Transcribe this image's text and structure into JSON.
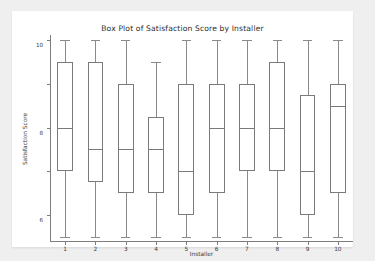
{
  "chart_data": {
    "type": "box",
    "title": "Box Plot of Satisfaction Score by Installer",
    "xlabel": "Installer",
    "ylabel": "Satisfaction Score",
    "categories": [
      "1",
      "2",
      "3",
      "4",
      "5",
      "6",
      "7",
      "8",
      "9",
      "10"
    ],
    "ylim": [
      1,
      10
    ],
    "yticks": [
      2,
      4,
      6,
      8,
      10
    ],
    "ytick_labels": [
      "2",
      "4",
      "6",
      "8",
      "10"
    ],
    "grid": false,
    "legend": null,
    "boxes": [
      {
        "category": "1",
        "whisker_low": 1,
        "q1": 4,
        "median": 6,
        "q3": 9,
        "whisker_high": 10
      },
      {
        "category": "2",
        "whisker_low": 1,
        "q1": 3.5,
        "median": 5,
        "q3": 9,
        "whisker_high": 10
      },
      {
        "category": "3",
        "whisker_low": 1,
        "q1": 3,
        "median": 5,
        "q3": 8,
        "whisker_high": 10
      },
      {
        "category": "4",
        "whisker_low": 1,
        "q1": 3,
        "median": 5,
        "q3": 6.5,
        "whisker_high": 9
      },
      {
        "category": "5",
        "whisker_low": 1,
        "q1": 2,
        "median": 4,
        "q3": 8,
        "whisker_high": 10
      },
      {
        "category": "6",
        "whisker_low": 1,
        "q1": 3,
        "median": 6,
        "q3": 8,
        "whisker_high": 10
      },
      {
        "category": "7",
        "whisker_low": 1,
        "q1": 4,
        "median": 6,
        "q3": 8,
        "whisker_high": 10
      },
      {
        "category": "8",
        "whisker_low": 1,
        "q1": 4,
        "median": 6,
        "q3": 9,
        "whisker_high": 10
      },
      {
        "category": "9",
        "whisker_low": 1,
        "q1": 2,
        "median": 4,
        "q3": 7.5,
        "whisker_high": 10
      },
      {
        "category": "10",
        "whisker_low": 1,
        "q1": 3,
        "median": 7,
        "q3": 8,
        "whisker_high": 10
      }
    ]
  },
  "colors": {
    "page_background": "#efefef",
    "figure_background": "#ffffff",
    "box_edge": "#7a7a7a",
    "whisker": "#8a8a8a",
    "axis": "#7d7d7d",
    "text": "#3a3a3a",
    "title_text": "#2b2b2b"
  }
}
